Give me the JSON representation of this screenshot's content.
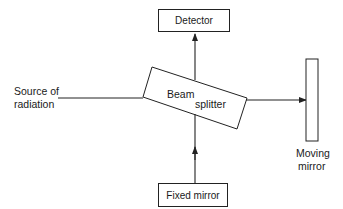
{
  "diagram": {
    "type": "Michelson interferometer schematic",
    "nodes": {
      "detector": {
        "label": "Detector"
      },
      "beam_splitter": {
        "label_line1": "Beam",
        "label_line2": "splitter"
      },
      "source": {
        "label_line1": "Source of",
        "label_line2": "radiation"
      },
      "moving_mirror": {
        "label_line1": "Moving",
        "label_line2": "mirror"
      },
      "fixed_mirror": {
        "label": "Fixed mirror"
      }
    },
    "edges": [
      {
        "from": "source",
        "to": "beam_splitter",
        "arrow": false
      },
      {
        "from": "beam_splitter",
        "to": "detector",
        "arrow": true
      },
      {
        "from": "beam_splitter",
        "to": "moving_mirror",
        "arrow": true
      },
      {
        "from": "fixed_mirror",
        "to": "beam_splitter",
        "arrow": true
      }
    ],
    "colors": {
      "stroke": "#222222",
      "background": "#ffffff"
    }
  }
}
